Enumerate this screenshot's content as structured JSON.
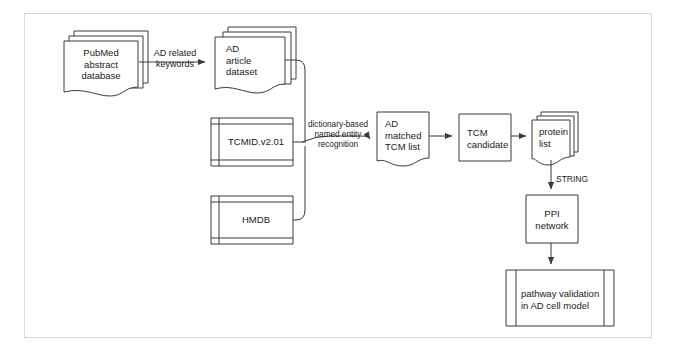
{
  "diagram": {
    "stroke_color": "#3a3a3a",
    "frame_color": "#d8d8d8",
    "text_color": "#1a1a1a",
    "background": "#ffffff",
    "nodes": [
      {
        "id": "pubmed",
        "shape": "multi-document",
        "label": "PubMed\nabstract\ndatabase",
        "align": "center"
      },
      {
        "id": "ad_article",
        "shape": "multi-document",
        "label": "AD\narticle\ndataset",
        "align": "left"
      },
      {
        "id": "tcmid",
        "shape": "database-box",
        "label": "TCMID.v2.01",
        "align": "center"
      },
      {
        "id": "hmdb",
        "shape": "database-box",
        "label": "HMDB",
        "align": "center"
      },
      {
        "id": "ad_tcm",
        "shape": "document",
        "label": "AD\nmatched\nTCM list",
        "align": "left"
      },
      {
        "id": "tcm_cand",
        "shape": "rectangle",
        "label": "TCM\ncandidate",
        "align": "left"
      },
      {
        "id": "protein",
        "shape": "multi-document",
        "label": "protein\nlist",
        "align": "left"
      },
      {
        "id": "ppi",
        "shape": "rectangle",
        "label": "PPI\nnetwork",
        "align": "center"
      },
      {
        "id": "pathway",
        "shape": "predefined-process",
        "label": "pathway validation\nin AD cell model",
        "align": "left"
      }
    ],
    "edges": [
      {
        "id": "e1",
        "from": "pubmed",
        "to": "ad_article",
        "label": "AD related\nkeywords"
      },
      {
        "id": "e2",
        "from": "ad_article",
        "to": "ad_tcm",
        "label": ""
      },
      {
        "id": "e3",
        "from": "tcmid",
        "to": "ad_tcm",
        "label": "dictionary-based\nnamed entity\nrecognition"
      },
      {
        "id": "e4",
        "from": "hmdb",
        "to": "ad_tcm",
        "label": ""
      },
      {
        "id": "e5",
        "from": "ad_tcm",
        "to": "tcm_cand",
        "label": ""
      },
      {
        "id": "e6",
        "from": "tcm_cand",
        "to": "protein",
        "label": ""
      },
      {
        "id": "e7",
        "from": "protein",
        "to": "ppi",
        "label": "STRING"
      },
      {
        "id": "e8",
        "from": "ppi",
        "to": "pathway",
        "label": ""
      }
    ]
  }
}
